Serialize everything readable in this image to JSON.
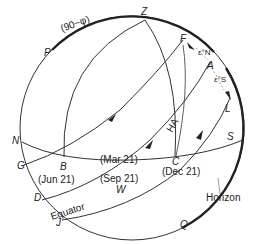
{
  "diagram": {
    "labels": {
      "zenith": "Z",
      "arc_colatitude": "(90−φ)",
      "P": "P",
      "F": "F",
      "eps_N": "ε°N",
      "A": "A",
      "eps_S": "ε°S",
      "L": "L",
      "S": "S",
      "N": "N",
      "G": "G",
      "B": "B",
      "D": "D",
      "J": "J",
      "W": "W",
      "C": "C",
      "Q": "Q",
      "HA": "HA",
      "jun21": "(Jun  21)",
      "mar21": "(Mar 21)",
      "sep21": "(Sep  21)",
      "dec21": "(Dec 21)",
      "equator": "Equator",
      "horizon": "Horizon"
    },
    "colors": {
      "line": "#333333",
      "text": "#222222",
      "background": "#ffffff"
    }
  }
}
